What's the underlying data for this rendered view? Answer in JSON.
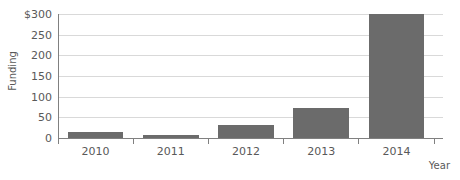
{
  "chart_data": {
    "type": "bar",
    "title": "",
    "subtitle": "",
    "categories": [
      "2010",
      "2011",
      "2012",
      "2013",
      "2014"
    ],
    "values": [
      15,
      8,
      32,
      75,
      305
    ],
    "xlabel": "Year",
    "ylabel": "Funding",
    "ylim": [
      0,
      305
    ],
    "y_ticks": [
      0,
      50,
      100,
      150,
      200,
      250,
      300
    ],
    "y_tick_labels": [
      "0",
      "50",
      "100",
      "150",
      "200",
      "250",
      "$300"
    ],
    "grid": true,
    "legend": false,
    "legend_position": "none",
    "series": [
      {
        "name": "Funding",
        "values": [
          15,
          8,
          32,
          75,
          305
        ],
        "color": "#6b6b6b"
      }
    ],
    "annotations": []
  },
  "colors": {
    "bar": "#6b6b6b",
    "gridline": "#d9d9d9",
    "axis": "#808080",
    "text": "#595959",
    "background": "#ffffff"
  }
}
